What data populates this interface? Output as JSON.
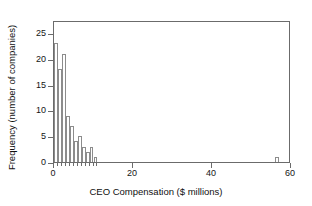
{
  "chart_data": {
    "type": "bar",
    "title": "",
    "subtitle": "",
    "xlabel": "CEO Compensation ($ millions)",
    "ylabel": "Frequency (number of companies)",
    "xlim": [
      0,
      60
    ],
    "ylim": [
      0,
      27.5
    ],
    "grid": false,
    "legend": null,
    "bin_width": 1,
    "x_tick_labels": [
      "0",
      "20",
      "40",
      "60"
    ],
    "x_tick_values": [
      0,
      20,
      40,
      60
    ],
    "y_tick_labels": [
      "0",
      "5",
      "10",
      "15",
      "20",
      "25"
    ],
    "y_tick_values": [
      0,
      5,
      10,
      15,
      20,
      25
    ],
    "x_minor_tick_step": 1,
    "x_minor_tick_range": [
      0,
      11
    ],
    "bins": [
      {
        "x0": 0,
        "x1": 1,
        "value": 23
      },
      {
        "x0": 1,
        "x1": 2,
        "value": 18
      },
      {
        "x0": 2,
        "x1": 3,
        "value": 21
      },
      {
        "x0": 3,
        "x1": 4,
        "value": 9
      },
      {
        "x0": 4,
        "x1": 5,
        "value": 7
      },
      {
        "x0": 5,
        "x1": 6,
        "value": 4
      },
      {
        "x0": 6,
        "x1": 7,
        "value": 5
      },
      {
        "x0": 7,
        "x1": 8,
        "value": 3
      },
      {
        "x0": 8,
        "x1": 9,
        "value": 2
      },
      {
        "x0": 9,
        "x1": 10,
        "value": 3
      },
      {
        "x0": 10,
        "x1": 11,
        "value": 1
      },
      {
        "x0": 56,
        "x1": 57,
        "value": 1
      }
    ],
    "categories": [
      "0-1",
      "1-2",
      "2-3",
      "3-4",
      "4-5",
      "5-6",
      "6-7",
      "7-8",
      "8-9",
      "9-10",
      "10-11",
      "56-57"
    ],
    "values": [
      23,
      18,
      21,
      9,
      7,
      4,
      5,
      3,
      2,
      3,
      1,
      1
    ],
    "colors": {
      "bar_fill": "#ffffff",
      "bar_stroke": "#8c8c8c",
      "axis": "#6b6b6b",
      "text": "#151515",
      "background": "#ffffff"
    }
  }
}
